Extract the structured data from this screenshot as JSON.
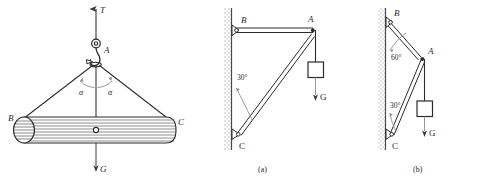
{
  "figure": {
    "title": "",
    "panels": [
      {
        "id": "panel-left",
        "caption": "",
        "labels": {
          "tension": "T",
          "apex": "A",
          "left_end": "B",
          "right_end": "C",
          "weight": "G",
          "angle_left": "α",
          "angle_right": "α"
        },
        "elements": {
          "hook": "hook-icon",
          "load": "cylinder-log",
          "slings": "two-sling-cables"
        }
      },
      {
        "id": "panel-a",
        "caption": "(a)",
        "labels": {
          "top_joint": "B",
          "apex": "A",
          "bottom_joint": "C",
          "weight": "G",
          "angle_c": "30°"
        },
        "elements": {
          "wall": "hatched-wall",
          "beam": "horizontal-beam-BA",
          "strut": "diagonal-strut-CA",
          "load": "suspended-block"
        }
      },
      {
        "id": "panel-b",
        "caption": "(b)",
        "labels": {
          "top_joint": "B",
          "apex": "A",
          "bottom_joint": "C",
          "weight": "G",
          "angle_b": "60°",
          "angle_c": "30°"
        },
        "elements": {
          "wall": "hatched-wall",
          "beam": "inclined-member-BA",
          "strut": "diagonal-strut-CA",
          "load": "suspended-block"
        }
      }
    ],
    "colors": {
      "line": "#2b2b2b",
      "wall_hatch": "#9a9a9a",
      "background": "#ffffff"
    }
  }
}
